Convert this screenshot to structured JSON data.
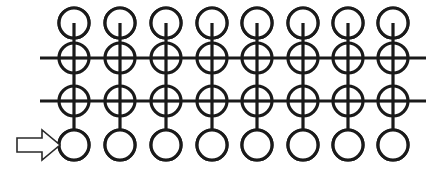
{
  "figure": {
    "background_color": "#ffffff",
    "ink_color": "#1a1a1a",
    "width": 440,
    "height": 173,
    "columns": 8,
    "rows": 4
  },
  "geometry": {
    "column_centers": [
      74,
      120,
      166,
      212,
      257,
      303,
      348,
      393
    ],
    "row_centers": [
      23,
      58,
      101,
      145
    ],
    "node_radius": 15,
    "xor_radius": 15,
    "stroke_width": 3.2,
    "wire_stroke_width": 3.2,
    "horizontal_wire_x_start": 40,
    "horizontal_wire_x_end": 426
  },
  "rows": [
    {
      "index": 0,
      "name": "top-open-node-row",
      "node_type": "open-circle",
      "y": 23,
      "has_horizontal_wire": false,
      "stub": "vertical line entering circle from below to center"
    },
    {
      "index": 1,
      "name": "upper-xor-row",
      "node_type": "xor-gate",
      "y": 58,
      "has_horizontal_wire": true,
      "wire_label": "upper horizontal wire"
    },
    {
      "index": 2,
      "name": "lower-xor-row",
      "node_type": "xor-gate",
      "y": 101,
      "has_horizontal_wire": true,
      "wire_label": "lower horizontal wire"
    },
    {
      "index": 3,
      "name": "bottom-open-node-row",
      "node_type": "open-circle",
      "y": 145,
      "has_horizontal_wire": false,
      "stub": "vertical line descending to top edge of circle"
    }
  ],
  "columns": [
    {
      "index": 0,
      "x": 74,
      "name": "column-1"
    },
    {
      "index": 1,
      "x": 120,
      "name": "column-2"
    },
    {
      "index": 2,
      "x": 166,
      "name": "column-3"
    },
    {
      "index": 3,
      "x": 212,
      "name": "column-4"
    },
    {
      "index": 4,
      "x": 257,
      "name": "column-5"
    },
    {
      "index": 5,
      "x": 303,
      "name": "column-6"
    },
    {
      "index": 6,
      "x": 348,
      "name": "column-7"
    },
    {
      "index": 7,
      "x": 393,
      "name": "column-8"
    }
  ],
  "annotation": {
    "arrow": {
      "name": "input-pointer-arrow",
      "shape": "hollow-block-arrow-right",
      "label": "",
      "points_at": "column-1 bottom open circle",
      "fill": "#ffffff",
      "stroke": "#2a2a2a",
      "tail_x": 17,
      "tip_x": 60,
      "center_y": 145,
      "shaft_half_height": 7,
      "head_half_height": 15,
      "head_back_x": 42
    }
  },
  "labels": {
    "caption": "",
    "axis_labels": [],
    "legend": []
  }
}
